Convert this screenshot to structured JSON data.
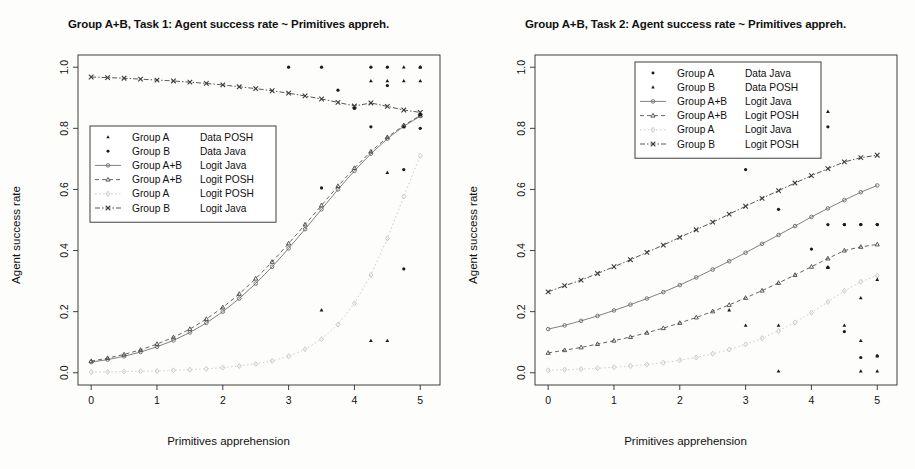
{
  "figure": {
    "background": "#fdfdfb",
    "ink": "#1a1a1a"
  },
  "panels": [
    {
      "id": "task1",
      "title": "Group A+B, Task 1: Agent success rate ~ Primitives appreh.",
      "xlabel": "Primitives apprehension",
      "ylabel": "Agent success rate",
      "xticks": [
        "0",
        "1",
        "2",
        "3",
        "4",
        "5"
      ],
      "yticks": [
        "0.0",
        "0.2",
        "0.4",
        "0.6",
        "0.8",
        "1.0"
      ],
      "legend": [
        {
          "label_left": "Group A",
          "label_right": "Data POSH",
          "marker": "triangle-filled",
          "line": "none",
          "color": "#1a1a1a"
        },
        {
          "label_left": "Group B",
          "label_right": "Data Java",
          "marker": "circle-filled",
          "line": "none",
          "color": "#1a1a1a"
        },
        {
          "label_left": "Group A+B",
          "label_right": "Logit Java",
          "marker": "circle-open",
          "line": "solid",
          "color": "#6b6b6b"
        },
        {
          "label_left": "Group A+B",
          "label_right": "Logit POSH",
          "marker": "triangle-open",
          "line": "dashed",
          "color": "#4a4a4a"
        },
        {
          "label_left": "Group A",
          "label_right": "Logit POSH",
          "marker": "diamond-open",
          "line": "dotted",
          "color": "#c4c4c4"
        },
        {
          "label_left": "Group B",
          "label_right": "Logit Java",
          "marker": "cross",
          "line": "dashdot",
          "color": "#3a3a3a"
        }
      ]
    },
    {
      "id": "task2",
      "title": "Group A+B, Task 2: Agent success rate ~ Primitives appreh.",
      "xlabel": "Primitives apprehension",
      "ylabel": "Agent success rate",
      "xticks": [
        "0",
        "1",
        "2",
        "3",
        "4",
        "5"
      ],
      "yticks": [
        "0.0",
        "0.2",
        "0.4",
        "0.6",
        "0.8",
        "1.0"
      ],
      "legend": [
        {
          "label_left": "Group A",
          "label_right": "Data Java",
          "marker": "circle-filled",
          "line": "none",
          "color": "#1a1a1a"
        },
        {
          "label_left": "Group B",
          "label_right": "Data POSH",
          "marker": "triangle-filled",
          "line": "none",
          "color": "#1a1a1a"
        },
        {
          "label_left": "Group A+B",
          "label_right": "Logit Java",
          "marker": "circle-open",
          "line": "solid",
          "color": "#6b6b6b"
        },
        {
          "label_left": "Group A+B",
          "label_right": "Logit POSH",
          "marker": "triangle-open",
          "line": "dashed",
          "color": "#4a4a4a"
        },
        {
          "label_left": "Group A",
          "label_right": "Logit Java",
          "marker": "diamond-open",
          "line": "dotted",
          "color": "#c4c4c4"
        },
        {
          "label_left": "Group B",
          "label_right": "Logit POSH",
          "marker": "cross",
          "line": "dashdot",
          "color": "#3a3a3a"
        }
      ]
    }
  ],
  "chart_data": [
    {
      "type": "scatter",
      "panel": "task1",
      "title": "Group A+B, Task 1: Agent success rate ~ Primitives appreh.",
      "xlabel": "Primitives apprehension",
      "ylabel": "Agent success rate",
      "xlim": [
        -0.2,
        5.3
      ],
      "ylim": [
        -0.04,
        1.04
      ],
      "xticks": [
        0,
        1,
        2,
        3,
        4,
        5
      ],
      "yticks": [
        0.0,
        0.2,
        0.4,
        0.6,
        0.8,
        1.0
      ],
      "grid": false,
      "legend_position": "left-middle",
      "series": [
        {
          "name": "Group A+B Logit Java",
          "kind": "line-marker",
          "marker": "circle-open",
          "line": "solid",
          "color": "#6b6b6b",
          "x": [
            0,
            0.25,
            0.5,
            0.75,
            1.0,
            1.25,
            1.5,
            1.75,
            2.0,
            2.25,
            2.5,
            2.75,
            3.0,
            3.25,
            3.5,
            3.75,
            4.0,
            4.25,
            4.5,
            4.75,
            5.0
          ],
          "y": [
            0.035,
            0.043,
            0.054,
            0.068,
            0.085,
            0.106,
            0.132,
            0.163,
            0.2,
            0.243,
            0.292,
            0.347,
            0.407,
            0.47,
            0.535,
            0.6,
            0.661,
            0.717,
            0.766,
            0.807,
            0.84
          ]
        },
        {
          "name": "Group A+B Logit POSH",
          "kind": "line-marker",
          "marker": "triangle-open",
          "line": "dashed",
          "color": "#4a4a4a",
          "x": [
            0,
            0.25,
            0.5,
            0.75,
            1.0,
            1.25,
            1.5,
            1.75,
            2.0,
            2.25,
            2.5,
            2.75,
            3.0,
            3.25,
            3.5,
            3.75,
            4.0,
            4.25,
            4.5,
            4.75,
            5.0
          ],
          "y": [
            0.038,
            0.048,
            0.06,
            0.075,
            0.094,
            0.116,
            0.143,
            0.176,
            0.214,
            0.258,
            0.308,
            0.363,
            0.423,
            0.485,
            0.548,
            0.611,
            0.67,
            0.724,
            0.771,
            0.81,
            0.842
          ]
        },
        {
          "name": "Group A Logit POSH",
          "kind": "line-marker",
          "marker": "diamond-open",
          "line": "dotted",
          "color": "#c4c4c4",
          "x": [
            0,
            0.25,
            0.5,
            0.75,
            1.0,
            1.25,
            1.5,
            1.75,
            2.0,
            2.25,
            2.5,
            2.75,
            3.0,
            3.25,
            3.5,
            3.75,
            4.0,
            4.25,
            4.5,
            4.75,
            5.0
          ],
          "y": [
            0.002,
            0.003,
            0.004,
            0.005,
            0.006,
            0.008,
            0.01,
            0.013,
            0.017,
            0.022,
            0.029,
            0.039,
            0.054,
            0.077,
            0.11,
            0.158,
            0.227,
            0.32,
            0.44,
            0.577,
            0.71
          ]
        },
        {
          "name": "Group B Logit Java",
          "kind": "line-marker",
          "marker": "cross",
          "line": "dashdot",
          "color": "#3a3a3a",
          "x": [
            0,
            0.25,
            0.5,
            0.75,
            1.0,
            1.25,
            1.5,
            1.75,
            2.0,
            2.25,
            2.5,
            2.75,
            3.0,
            3.25,
            3.5,
            3.75,
            4.0,
            4.25,
            4.5,
            4.75,
            5.0
          ],
          "y": [
            0.968,
            0.966,
            0.964,
            0.961,
            0.958,
            0.955,
            0.951,
            0.947,
            0.942,
            0.936,
            0.93,
            0.923,
            0.915,
            0.906,
            0.896,
            0.885,
            0.873,
            0.883,
            0.872,
            0.86,
            0.852
          ]
        },
        {
          "name": "Group A Data POSH",
          "kind": "points",
          "marker": "triangle-filled",
          "color": "#1a1a1a",
          "x": [
            3.5,
            4.25,
            4.25,
            4.5,
            4.5,
            4.75,
            4.75,
            5.0,
            5.0,
            5.0,
            4.75,
            4.5
          ],
          "y": [
            0.205,
            0.955,
            0.105,
            0.955,
            0.655,
            1.0,
            0.955,
            1.0,
            0.955,
            0.845,
            0.805,
            0.105
          ]
        },
        {
          "name": "Group B Data Java",
          "kind": "points",
          "marker": "circle-filled",
          "color": "#1a1a1a",
          "x": [
            3.0,
            3.5,
            3.5,
            3.75,
            4.0,
            4.25,
            4.25,
            4.5,
            4.5,
            4.75,
            4.75,
            5.0,
            5.0,
            5.0
          ],
          "y": [
            1.0,
            1.0,
            0.605,
            0.925,
            0.865,
            1.0,
            0.805,
            1.0,
            0.94,
            0.34,
            0.665,
            1.0,
            0.8,
            0.845
          ]
        }
      ]
    },
    {
      "type": "scatter",
      "panel": "task2",
      "title": "Group A+B, Task 2: Agent success rate ~ Primitives appreh.",
      "xlabel": "Primitives apprehension",
      "ylabel": "Agent success rate",
      "xlim": [
        -0.2,
        5.3
      ],
      "ylim": [
        -0.04,
        1.04
      ],
      "xticks": [
        0,
        1,
        2,
        3,
        4,
        5
      ],
      "yticks": [
        0.0,
        0.2,
        0.4,
        0.6,
        0.8,
        1.0
      ],
      "grid": false,
      "legend_position": "top-left",
      "series": [
        {
          "name": "Group B Logit POSH",
          "kind": "line-marker",
          "marker": "cross",
          "line": "dashdot",
          "color": "#3a3a3a",
          "x": [
            0,
            0.25,
            0.5,
            0.75,
            1.0,
            1.25,
            1.5,
            1.75,
            2.0,
            2.25,
            2.5,
            2.75,
            3.0,
            3.25,
            3.5,
            3.75,
            4.0,
            4.25,
            4.5,
            4.75,
            5.0
          ],
          "y": [
            0.265,
            0.285,
            0.303,
            0.325,
            0.347,
            0.37,
            0.394,
            0.418,
            0.443,
            0.468,
            0.493,
            0.519,
            0.545,
            0.571,
            0.596,
            0.621,
            0.645,
            0.668,
            0.69,
            0.704,
            0.712
          ]
        },
        {
          "name": "Group A+B Logit Java",
          "kind": "line-marker",
          "marker": "circle-open",
          "line": "solid",
          "color": "#6b6b6b",
          "x": [
            0,
            0.25,
            0.5,
            0.75,
            1.0,
            1.25,
            1.5,
            1.75,
            2.0,
            2.25,
            2.5,
            2.75,
            3.0,
            3.25,
            3.5,
            3.75,
            4.0,
            4.25,
            4.5,
            4.75,
            5.0
          ],
          "y": [
            0.143,
            0.155,
            0.17,
            0.186,
            0.204,
            0.223,
            0.243,
            0.264,
            0.287,
            0.312,
            0.338,
            0.365,
            0.393,
            0.422,
            0.451,
            0.48,
            0.51,
            0.538,
            0.565,
            0.591,
            0.613
          ]
        },
        {
          "name": "Group A+B Logit POSH",
          "kind": "line-marker",
          "marker": "triangle-open",
          "line": "dashed",
          "color": "#4a4a4a",
          "x": [
            0,
            0.25,
            0.5,
            0.75,
            1.0,
            1.25,
            1.5,
            1.75,
            2.0,
            2.25,
            2.5,
            2.75,
            3.0,
            3.25,
            3.5,
            3.75,
            4.0,
            4.25,
            4.5,
            4.75,
            5.0
          ],
          "y": [
            0.065,
            0.074,
            0.083,
            0.094,
            0.105,
            0.117,
            0.131,
            0.146,
            0.163,
            0.181,
            0.201,
            0.222,
            0.245,
            0.269,
            0.294,
            0.32,
            0.347,
            0.374,
            0.4,
            0.412,
            0.42
          ]
        },
        {
          "name": "Group A Logit Java",
          "kind": "line-marker",
          "marker": "diamond-open",
          "line": "dotted",
          "color": "#c4c4c4",
          "x": [
            0,
            0.25,
            0.5,
            0.75,
            1.0,
            1.25,
            1.5,
            1.75,
            2.0,
            2.25,
            2.5,
            2.75,
            3.0,
            3.25,
            3.5,
            3.75,
            4.0,
            4.25,
            4.5,
            4.75,
            5.0
          ],
          "y": [
            0.008,
            0.01,
            0.012,
            0.015,
            0.018,
            0.022,
            0.027,
            0.033,
            0.041,
            0.05,
            0.062,
            0.076,
            0.093,
            0.113,
            0.137,
            0.165,
            0.197,
            0.232,
            0.268,
            0.298,
            0.318
          ]
        },
        {
          "name": "Group A Data Java",
          "kind": "points",
          "marker": "circle-filled",
          "color": "#1a1a1a",
          "x": [
            3.0,
            3.5,
            4.0,
            4.0,
            4.25,
            4.25,
            4.5,
            4.5,
            4.5,
            4.75,
            4.75,
            4.75,
            5.0,
            5.0,
            5.0,
            4.25
          ],
          "y": [
            0.665,
            0.535,
            0.805,
            0.405,
            0.805,
            0.485,
            0.485,
            0.485,
            0.135,
            0.485,
            0.485,
            0.05,
            0.485,
            0.485,
            0.055,
            0.345
          ]
        },
        {
          "name": "Group B Data POSH",
          "kind": "points",
          "marker": "triangle-filled",
          "color": "#1a1a1a",
          "x": [
            2.75,
            3.0,
            3.5,
            3.5,
            4.25,
            4.25,
            4.25,
            4.5,
            4.75,
            4.75,
            5.0,
            5.0,
            5.0,
            4.75
          ],
          "y": [
            0.205,
            0.155,
            0.005,
            0.155,
            0.855,
            0.345,
            0.345,
            0.155,
            0.245,
            0.005,
            0.305,
            0.055,
            0.005,
            0.105
          ]
        }
      ]
    }
  ]
}
